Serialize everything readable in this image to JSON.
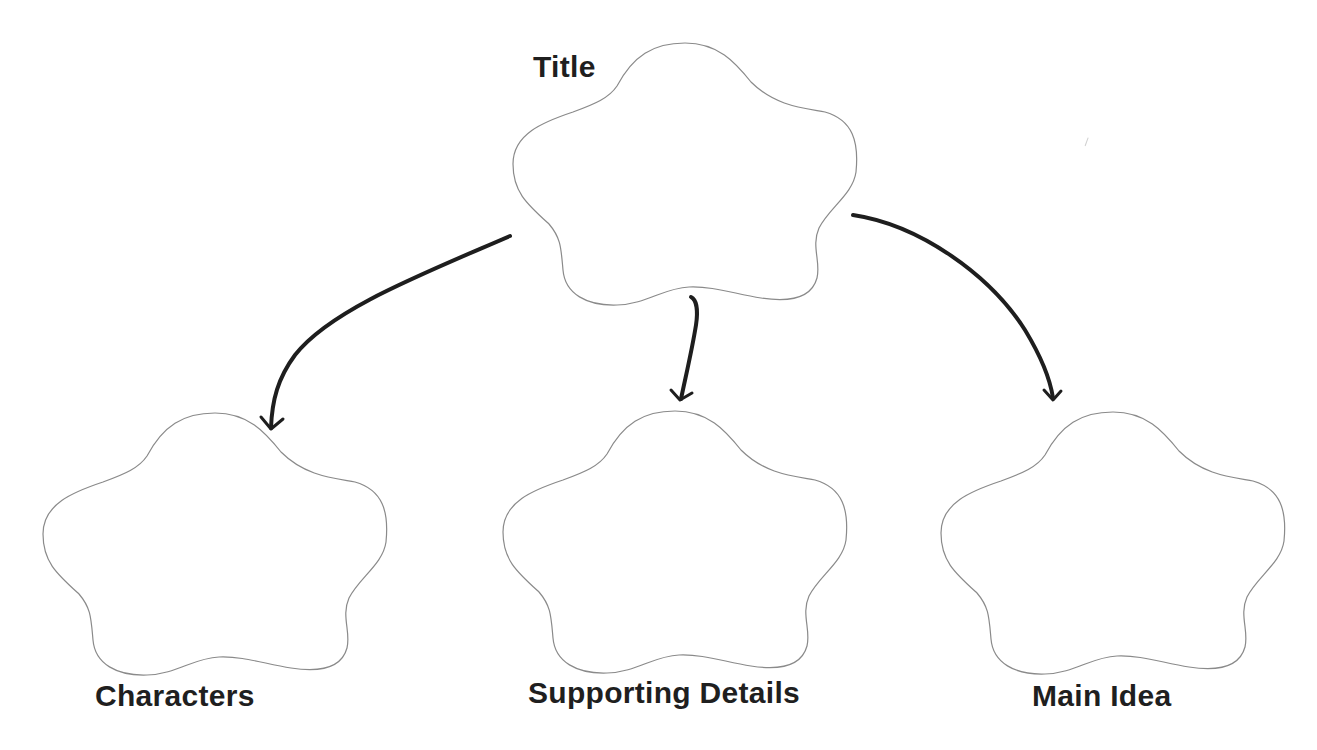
{
  "diagram": {
    "type": "graphic-organizer",
    "colors": {
      "background": "#ffffff",
      "cloud_outline": "#8a8a8a",
      "arrow": "#1e1e1e",
      "label_text": "#1f1f1f"
    },
    "nodes": [
      {
        "id": "title",
        "label": "Title",
        "shape": "cloud",
        "box": [
          513,
          42,
          858,
          303
        ]
      },
      {
        "id": "characters",
        "label": "Characters",
        "shape": "cloud",
        "box": [
          43,
          412,
          386,
          676
        ]
      },
      {
        "id": "supporting-details",
        "label": "Supporting Details",
        "shape": "cloud",
        "box": [
          503,
          410,
          847,
          672
        ]
      },
      {
        "id": "main-idea",
        "label": "Main Idea",
        "shape": "cloud",
        "box": [
          943,
          411,
          1283,
          673
        ]
      }
    ],
    "edges": [
      {
        "from": "title",
        "to": "characters"
      },
      {
        "from": "title",
        "to": "supporting-details"
      },
      {
        "from": "title",
        "to": "main-idea"
      }
    ]
  }
}
